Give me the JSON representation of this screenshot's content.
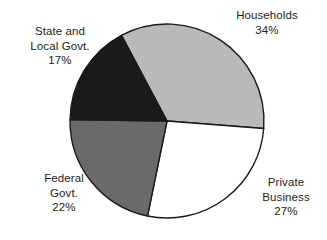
{
  "chart_data": {
    "type": "pie",
    "title": "",
    "subtitle": "",
    "xlabel": "",
    "ylabel": "",
    "legend_position": "none",
    "grid": false,
    "labels_outside": true,
    "unit": "%",
    "categories": [
      "Households",
      "Private Business",
      "Federal Govt.",
      "State and Local Govt."
    ],
    "values": [
      34,
      27,
      22,
      17
    ],
    "colors": [
      "#b9b9b9",
      "#ffffff",
      "#6a6a6a",
      "#1a1a1a"
    ],
    "total": 100,
    "start_angle_deg": -118,
    "direction": "clockwise",
    "slices": [
      {
        "name": "Households",
        "value": 34,
        "display_value": "34%",
        "color": "#b9b9b9",
        "stroke": "#1a1a1a",
        "label_lines": [
          "Households"
        ],
        "label_percent": "34%"
      },
      {
        "name": "Private Business",
        "value": 27,
        "display_value": "27%",
        "color": "#ffffff",
        "stroke": "#1a1a1a",
        "label_lines": [
          "Private",
          "Business"
        ],
        "label_percent": "27%"
      },
      {
        "name": "Federal Govt.",
        "value": 22,
        "display_value": "22%",
        "color": "#6a6a6a",
        "stroke": "#1a1a1a",
        "label_lines": [
          "Federal",
          "Govt."
        ],
        "label_percent": "22%"
      },
      {
        "name": "State and Local Govt.",
        "value": 17,
        "display_value": "17%",
        "color": "#1a1a1a",
        "stroke": "#1a1a1a",
        "label_lines": [
          "State and",
          "Local Govt."
        ],
        "label_percent": "17%"
      }
    ],
    "geometry": {
      "center_x": 167,
      "center_y": 121,
      "radius": 97
    }
  },
  "labels": {
    "households": {
      "line1": "Households",
      "percent": "34%"
    },
    "state_local": {
      "line1": "State and",
      "line2": "Local Govt.",
      "percent": "17%"
    },
    "federal": {
      "line1": "Federal",
      "line2": "Govt.",
      "percent": "22%"
    },
    "private_business": {
      "line1": "Private",
      "line2": "Business",
      "percent": "27%"
    }
  }
}
